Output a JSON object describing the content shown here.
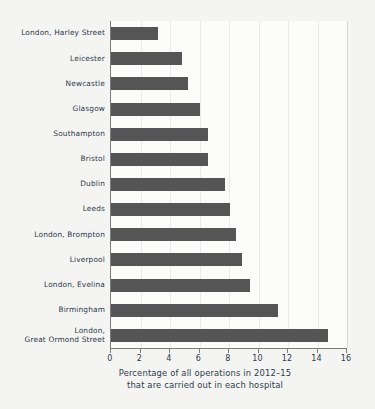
{
  "chart_data": {
    "type": "bar",
    "orientation": "horizontal",
    "title": "",
    "caption_line1": "Percentage of all operations in 2012–15",
    "caption_line2": "that are carried out in each hospital",
    "xlabel": "Percentage of all operations in 2012–15 that are carried out in each hospital",
    "ylabel": "",
    "xlim": [
      0,
      16
    ],
    "xticks": [
      0,
      2,
      4,
      6,
      8,
      10,
      12,
      14,
      16
    ],
    "xtick_labels": [
      "0",
      "2",
      "4",
      "6",
      "8",
      "10",
      "12",
      "14",
      "16"
    ],
    "grid": "vertical",
    "legend": "none",
    "bar_color": "#555555",
    "background_color": "#f4f4f2",
    "plot_background_color": "#fbfbfa",
    "axis_color": "#7d7d7d",
    "gridline_color": "#eaeaea",
    "text_color": "#2e3a4a",
    "categories": [
      "London, Harley Street",
      "Leicester",
      "Newcastle",
      "Glasgow",
      "Southampton",
      "Bristol",
      "Dublin",
      "Leeds",
      "London, Brompton",
      "Liverpool",
      "London, Evelina",
      "Birmingham",
      "London,\nGreat Ormond Street"
    ],
    "values": [
      3.2,
      4.8,
      5.2,
      6.0,
      6.6,
      6.6,
      7.7,
      8.1,
      8.5,
      8.9,
      9.4,
      11.3,
      14.7
    ]
  }
}
